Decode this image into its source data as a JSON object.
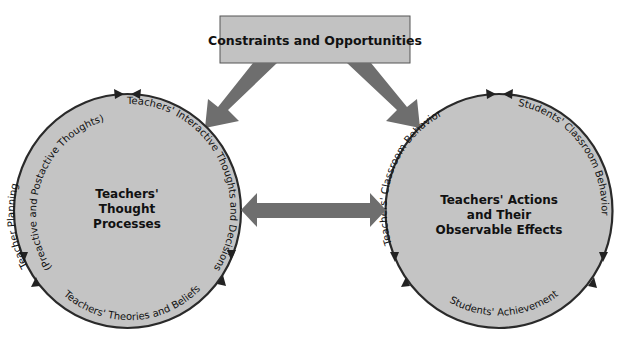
{
  "colors": {
    "circle_fill": "#c4c4c4",
    "circle_stroke": "#2a2a2a",
    "box_fill": "#c2c2c2",
    "arrow_fill": "#6e6e6e",
    "text": "#111111"
  },
  "top_box": {
    "label": "Constraints and Opportunities"
  },
  "left_circle": {
    "title_lines": [
      "Teachers'",
      "Thought",
      "Processes"
    ],
    "arc_labels": {
      "planning_line1": "Teacher Planning",
      "planning_line2": "(Preactive and Postactive Thoughts)",
      "interactive": "Teachers' Interactive Thoughts and Decisions",
      "theories": "Teachers' Theories and Beliefs"
    }
  },
  "right_circle": {
    "title_lines": [
      "Teachers' Actions",
      "and Their",
      "Observable Effects"
    ],
    "arc_labels": {
      "teacher_behavior": "Teachers' Classroom Behavior",
      "student_behavior": "Students' Classroom Behavior",
      "achievement": "Students' Achievement"
    }
  },
  "connectors": [
    {
      "from": "top_box",
      "to": "left_circle",
      "type": "arrow"
    },
    {
      "from": "top_box",
      "to": "right_circle",
      "type": "arrow"
    },
    {
      "from": "left_circle",
      "to": "right_circle",
      "type": "double-arrow"
    }
  ]
}
